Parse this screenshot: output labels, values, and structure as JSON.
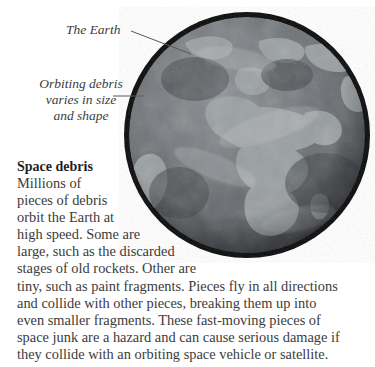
{
  "figure": {
    "background_color": "#ffffff",
    "text_color": "#3c3c3c"
  },
  "illustration": {
    "name": "earth-globe-with-debris-ring",
    "description": "Grayscale photographic globe showing Europe, Africa and the Atlantic, encircled by a thick dark ring of orbiting debris",
    "ring_color": "#090909",
    "ocean_color": "#6f7276",
    "land_color": "#9ba0a2",
    "center_x": 247,
    "center_y": 135,
    "radius": 128,
    "ring_thickness": 10
  },
  "callouts": [
    {
      "id": "the-earth",
      "lines": [
        "The Earth"
      ],
      "leader": {
        "x1": 131,
        "y1": 31,
        "x2": 191,
        "y2": 54
      }
    },
    {
      "id": "orbiting-debris",
      "lines": [
        "Orbiting debris",
        "varies in size",
        "and shape"
      ],
      "leader": {
        "x1": 113,
        "y1": 96,
        "x2": 144,
        "y2": 96
      }
    }
  ],
  "article": {
    "heading": "Space debris",
    "lines": [
      "Millions of",
      "pieces of debris",
      "orbit the Earth at",
      "high speed. Some are",
      "large, such as the discarded",
      "stages of old rockets. Other are",
      "tiny, such as paint fragments. Pieces fly in all directions",
      "and collide with other pieces, breaking them up into",
      "even smaller fragments. These fast-moving pieces of",
      "space junk are a hazard and can cause serious damage if",
      "they collide with an orbiting space vehicle or satellite."
    ],
    "full_text": "Millions of pieces of debris orbit the Earth at high speed. Some are large, such as the discarded stages of old rockets. Other are tiny, such as paint fragments. Pieces fly in all directions and collide with other pieces, breaking them up into even smaller fragments. These fast-moving pieces of space junk are a hazard and can cause serious damage if they collide with an orbiting space vehicle or satellite."
  }
}
